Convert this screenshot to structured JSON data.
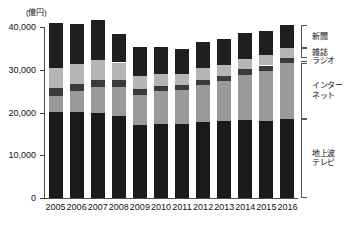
{
  "chart_data": {
    "type": "bar",
    "stacked": true,
    "title": "",
    "subtitle": "",
    "unit_label": "(億円)",
    "xlabel": "",
    "ylabel": "",
    "ylim": [
      0,
      40000
    ],
    "yticks": [
      0,
      10000,
      20000,
      30000,
      40000
    ],
    "ytick_labels": [
      "0",
      "10,000",
      "20,000",
      "30,000",
      "40,000"
    ],
    "grid": false,
    "legend_position": "right",
    "categories": [
      "2005",
      "2006",
      "2007",
      "2008",
      "2009",
      "2010",
      "2011",
      "2012",
      "2013",
      "2014",
      "2015",
      "2016"
    ],
    "series": [
      {
        "name": "地上波テレビ",
        "color": "#1a1a1a",
        "values": [
          20100,
          20200,
          19900,
          19100,
          17100,
          17300,
          17200,
          17800,
          17900,
          18300,
          18100,
          18400
        ]
      },
      {
        "name": "インターネット",
        "color": "#9a9a9a",
        "values": [
          3800,
          4800,
          6000,
          6900,
          7100,
          7700,
          8100,
          8700,
          9400,
          10500,
          11600,
          13100
        ]
      },
      {
        "name": "ラジオ",
        "color": "#3a3a3a",
        "values": [
          1800,
          1700,
          1700,
          1600,
          1400,
          1300,
          1200,
          1200,
          1200,
          1300,
          1300,
          1300
        ]
      },
      {
        "name": "雑誌",
        "color": "#b5b5b5",
        "values": [
          4800,
          4600,
          4600,
          4100,
          3000,
          2700,
          2500,
          2600,
          2500,
          2500,
          2400,
          2200
        ]
      },
      {
        "name": "新聞",
        "color": "#1f1f1f",
        "values": [
          10400,
          9500,
          9500,
          6700,
          6700,
          6400,
          5900,
          6200,
          6200,
          6000,
          5700,
          5400
        ]
      }
    ],
    "totals": [
      40900,
      40800,
      41700,
      38400,
      35300,
      35400,
      34900,
      36500,
      37200,
      38600,
      39100,
      40400
    ]
  },
  "legend": {
    "items": [
      {
        "label": "新聞"
      },
      {
        "label": "雑誌"
      },
      {
        "label": "ラジオ"
      },
      {
        "label": "インター\nネット",
        "line1": "インター",
        "line2": "ネット"
      },
      {
        "label": "地上波\nテレビ",
        "line1": "地上波",
        "line2": "テレビ"
      }
    ]
  }
}
